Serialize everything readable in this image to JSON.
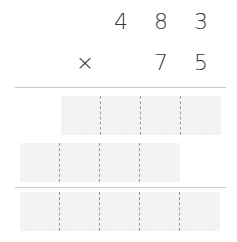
{
  "problem": {
    "multiplicand": [
      "4",
      "8",
      "3"
    ],
    "operator": "×",
    "multiplier": [
      "7",
      "5"
    ]
  },
  "answer_rows": [
    {
      "cells": 4,
      "offset": "units"
    },
    {
      "cells": 4,
      "offset": "tens"
    },
    {
      "cells": 5,
      "offset": "units"
    }
  ]
}
